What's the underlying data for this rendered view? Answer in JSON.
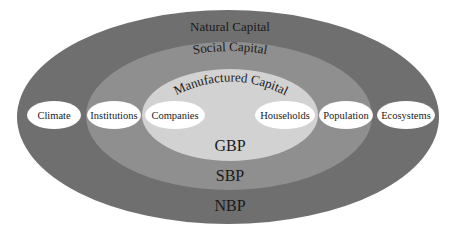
{
  "diagram": {
    "colors": {
      "natural": "#6f6f6f",
      "social": "#8f8f8f",
      "manufactured": "#d2d2d2",
      "oval": "#ffffff",
      "text": "#1a1a1a"
    },
    "rings": {
      "natural": {
        "label": "Natural Capital",
        "bottom_label": "NBP"
      },
      "social": {
        "label": "Social Capital",
        "bottom_label": "SBP"
      },
      "manufactured": {
        "label": "Manufactured Capital",
        "bottom_label": "GBP"
      }
    },
    "ovals": [
      {
        "label": "Climate"
      },
      {
        "label": "Institutions"
      },
      {
        "label": "Companies"
      },
      {
        "label": "Households"
      },
      {
        "label": "Population"
      },
      {
        "label": "Ecosystems"
      }
    ]
  }
}
